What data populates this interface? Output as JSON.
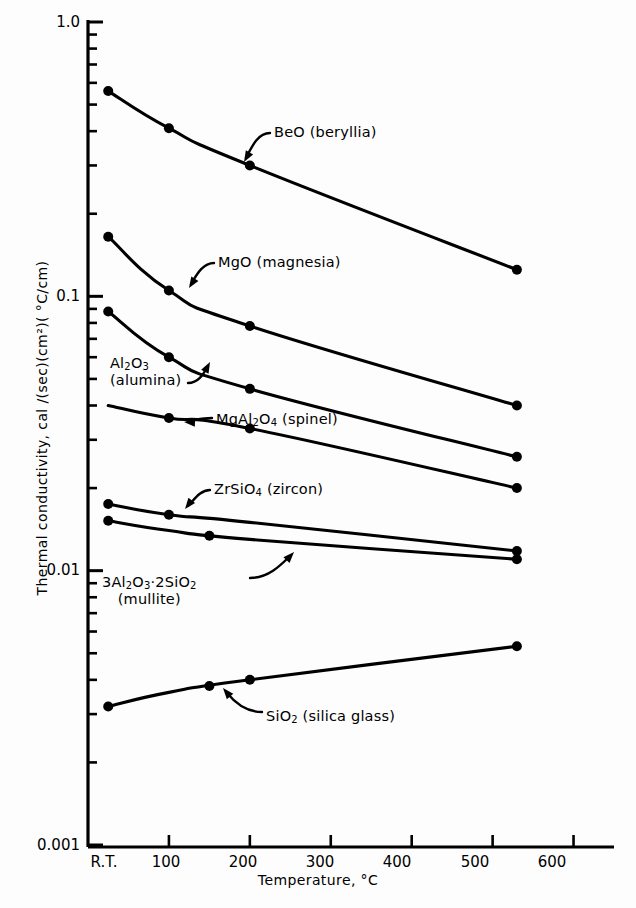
{
  "chart_data": {
    "type": "line",
    "title": "",
    "xlabel": "Temperature, °C",
    "ylabel": "Thermal conductivity, cal /(sec)(cm²)( °C/cm)",
    "xlim": [
      0,
      650
    ],
    "ylim": [
      0.001,
      1.0
    ],
    "yscale": "log",
    "xscale": "linear",
    "grid": false,
    "legend_position": "inline-annotations",
    "xticks": [
      {
        "value": 25,
        "label": "R.T."
      },
      {
        "value": 100,
        "label": "100"
      },
      {
        "value": 200,
        "label": "200"
      },
      {
        "value": 300,
        "label": "300"
      },
      {
        "value": 400,
        "label": "400"
      },
      {
        "value": 500,
        "label": "500"
      },
      {
        "value": 600,
        "label": "600"
      }
    ],
    "yticks": [
      {
        "value": 1.0,
        "label": "1.0"
      },
      {
        "value": 0.1,
        "label": "0.1"
      },
      {
        "value": 0.01,
        "label": "0.01"
      },
      {
        "value": 0.001,
        "label": "0.001"
      }
    ],
    "yminorticks": [
      0.9,
      0.8,
      0.7,
      0.6,
      0.5,
      0.4,
      0.3,
      0.2,
      0.09,
      0.08,
      0.07,
      0.06,
      0.05,
      0.04,
      0.03,
      0.02,
      0.009,
      0.008,
      0.007,
      0.006,
      0.005,
      0.004,
      0.003,
      0.002
    ],
    "series": [
      {
        "name": "BeO (beryllia)",
        "label": "BeO (beryllia)",
        "label_html": "BeO (beryllia)",
        "x": [
          25,
          100,
          200,
          530
        ],
        "y": [
          0.56,
          0.41,
          0.3,
          0.125
        ],
        "markers": [
          {
            "x": 25,
            "y": 0.56
          },
          {
            "x": 100,
            "y": 0.41
          },
          {
            "x": 200,
            "y": 0.3
          },
          {
            "x": 530,
            "y": 0.125
          }
        ]
      },
      {
        "name": "MgO (magnesia)",
        "label": "MgO (magnesia)",
        "label_html": "MgO (magnesia)",
        "x": [
          25,
          100,
          200,
          530
        ],
        "y": [
          0.165,
          0.105,
          0.078,
          0.04
        ],
        "markers": [
          {
            "x": 25,
            "y": 0.165
          },
          {
            "x": 100,
            "y": 0.105
          },
          {
            "x": 200,
            "y": 0.078
          },
          {
            "x": 530,
            "y": 0.04
          }
        ]
      },
      {
        "name": "Al2O3 (alumina)",
        "label": "Al₂O₃ (alumina)",
        "label_html": "Al<sub>2</sub>O<sub>3</sub>\n(alumina)",
        "x": [
          25,
          100,
          200,
          530
        ],
        "y": [
          0.088,
          0.06,
          0.046,
          0.026
        ],
        "markers": [
          {
            "x": 25,
            "y": 0.088
          },
          {
            "x": 100,
            "y": 0.06
          },
          {
            "x": 200,
            "y": 0.046
          },
          {
            "x": 530,
            "y": 0.026
          }
        ]
      },
      {
        "name": "MgAl2O4 (spinel)",
        "label": "MgAl₂O₄ (spinel)",
        "label_html": "MgAl<sub>2</sub>O<sub>4</sub> (spinel)",
        "x": [
          25,
          100,
          200,
          530
        ],
        "y": [
          0.04,
          0.036,
          0.033,
          0.02
        ],
        "markers": [
          {
            "x": 100,
            "y": 0.036
          },
          {
            "x": 200,
            "y": 0.033
          },
          {
            "x": 530,
            "y": 0.02
          }
        ]
      },
      {
        "name": "ZrSiO4 (zircon)",
        "label": "ZrSiO₄ (zircon)",
        "label_html": "ZrSiO<sub>4</sub> (zircon)",
        "x": [
          25,
          100,
          200,
          530
        ],
        "y": [
          0.0175,
          0.016,
          0.015,
          0.0118
        ],
        "markers": [
          {
            "x": 25,
            "y": 0.0175
          },
          {
            "x": 100,
            "y": 0.016
          },
          {
            "x": 530,
            "y": 0.0118
          }
        ]
      },
      {
        "name": "3Al2O3 2SiO2 (mullite)",
        "label": "3Al₂O₃·2SiO₂ (mullite)",
        "label_html": "3Al<sub>2</sub>O<sub>3</sub>·2SiO<sub>2</sub>\n(mullite)",
        "x": [
          25,
          100,
          200,
          530
        ],
        "y": [
          0.0152,
          0.014,
          0.013,
          0.011
        ],
        "markers": [
          {
            "x": 25,
            "y": 0.0152
          },
          {
            "x": 150,
            "y": 0.0134
          },
          {
            "x": 530,
            "y": 0.011
          }
        ]
      },
      {
        "name": "SiO2 (silica glass)",
        "label": "SiO₂ (silica glass)",
        "label_html": "SiO<sub>2</sub> (silica glass)",
        "x": [
          25,
          100,
          200,
          530
        ],
        "y": [
          0.0032,
          0.0036,
          0.004,
          0.0053
        ],
        "markers": [
          {
            "x": 25,
            "y": 0.0032
          },
          {
            "x": 150,
            "y": 0.0038
          },
          {
            "x": 200,
            "y": 0.004
          },
          {
            "x": 530,
            "y": 0.0053
          }
        ]
      }
    ],
    "annotations": [
      {
        "text": "BeO (beryllia)",
        "target_series": "BeO (beryllia)"
      },
      {
        "text": "MgO (magnesia)",
        "target_series": "MgO (magnesia)"
      },
      {
        "text": "Al2O3 (alumina)",
        "target_series": "Al2O3 (alumina)"
      },
      {
        "text": "MgAl2O4 (spinel)",
        "target_series": "MgAl2O4 (spinel)"
      },
      {
        "text": "ZrSiO4 (zircon)",
        "target_series": "ZrSiO4 (zircon)"
      },
      {
        "text": "3Al2O3 2SiO2 (mullite)",
        "target_series": "3Al2O3 2SiO2 (mullite)"
      },
      {
        "text": "SiO2 (silica glass)",
        "target_series": "SiO2 (silica glass)"
      }
    ]
  },
  "axes": {
    "x_title": "Temperature, °C",
    "y_title": "Thermal conductivity, cal /(sec)(cm²)( °C/cm)",
    "y_labels": [
      "1.0",
      "0.1",
      "0.01",
      "0.001"
    ],
    "x_labels": [
      "R.T.",
      "100",
      "200",
      "300",
      "400",
      "500",
      "600"
    ]
  },
  "colors": {
    "line": "#000000",
    "marker": "#000000",
    "background": "#ffffff",
    "text": "#000000"
  }
}
